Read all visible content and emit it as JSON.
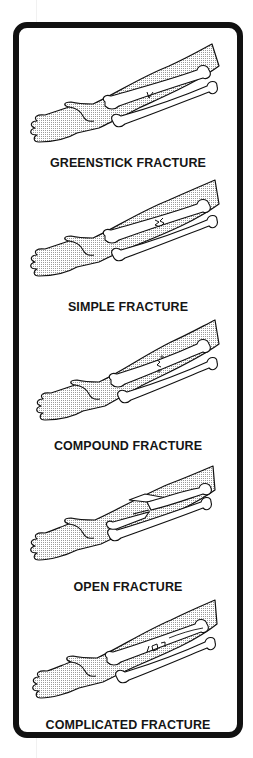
{
  "figure": {
    "colors": {
      "ink": "#111111",
      "shade": "#c8c8c8",
      "paper": "#ffffff"
    },
    "items": [
      {
        "label": "GREENSTICK FRACTURE",
        "fracture_mark": "partial crack on upper bone (one side bent)"
      },
      {
        "label": "SIMPLE FRACTURE",
        "fracture_mark": "zigzag break across upper bone"
      },
      {
        "label": "COMPOUND FRACTURE",
        "fracture_mark": "break with small fragments on upper bone"
      },
      {
        "label": "OPEN FRACTURE",
        "fracture_mark": "bone end displaced through skin"
      },
      {
        "label": "COMPLICATED FRACTURE",
        "fracture_mark": "break with loose bone pieces near vessel"
      }
    ]
  }
}
